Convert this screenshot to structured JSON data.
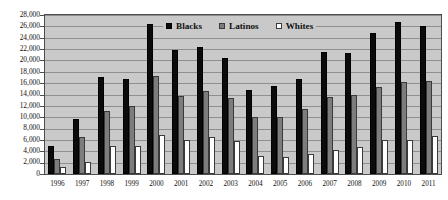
{
  "chart_data": {
    "type": "bar",
    "title": "",
    "subtitle": "",
    "xlabel": "",
    "ylabel": "",
    "ylim": [
      0,
      28000
    ],
    "ytick_step": 2000,
    "ytick_labels": [
      "28,000",
      "26,000",
      "24,000",
      "22,000",
      "20,000",
      "18,000",
      "16,000",
      "14,000",
      "12,000",
      "10,000",
      "8,000",
      "6,000",
      "4,000",
      "2,000",
      "0"
    ],
    "grid": true,
    "legend_position": "top-center-inside",
    "categories": [
      "1996",
      "1997",
      "1998",
      "1999",
      "2000",
      "2001",
      "2002",
      "2003",
      "2004",
      "2005",
      "2006",
      "2007",
      "2008",
      "2009",
      "2010",
      "2011"
    ],
    "series": [
      {
        "name": "Blacks",
        "color": "#0b0b0b",
        "values": [
          5000,
          9700,
          17000,
          16800,
          26500,
          21800,
          22400,
          20500,
          14800,
          15500,
          16700,
          21500,
          21300,
          24800,
          26800,
          26000
        ]
      },
      {
        "name": "Latinos",
        "color": "#7d7d7d",
        "values": [
          2700,
          6500,
          11100,
          12000,
          17200,
          13800,
          14700,
          13400,
          10000,
          10100,
          11500,
          13600,
          13900,
          15400,
          16200,
          16300
        ]
      },
      {
        "name": "Whites",
        "color": "#ffffff",
        "values": [
          1200,
          2200,
          5000,
          4900,
          6800,
          6000,
          6600,
          5800,
          3100,
          3000,
          3500,
          4300,
          4800,
          6000,
          6000,
          6700
        ]
      }
    ]
  },
  "legend": {
    "items": [
      {
        "label": "Blacks",
        "swatch": "blacks"
      },
      {
        "label": "Latinos",
        "swatch": "latinos"
      },
      {
        "label": "Whites",
        "swatch": "whites"
      }
    ]
  },
  "colors": {
    "plot_background": "#c9c9c9",
    "gridline": "#8f8f8f",
    "axis": "#4d4d4d",
    "page_background": "#ffffff"
  }
}
